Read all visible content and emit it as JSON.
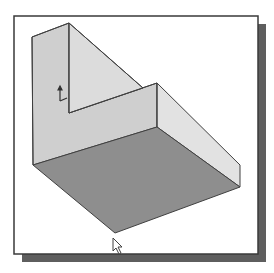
{
  "figure": {
    "colors": {
      "background": "#ffffff",
      "frame_border": "#3a3a3a",
      "frame_shadow": "#5e5e5e",
      "back_wall_face": "#cfcfcf",
      "back_wall_side": "#dedede",
      "right_wall_front": "#d2d2d2",
      "right_wall_side": "#e2e2e2",
      "floor": "#8e8e8e",
      "edge": "#404040"
    },
    "icons": {
      "origin_triad": "coordinate-axes-icon",
      "cursor": "mouse-pointer-icon"
    }
  }
}
